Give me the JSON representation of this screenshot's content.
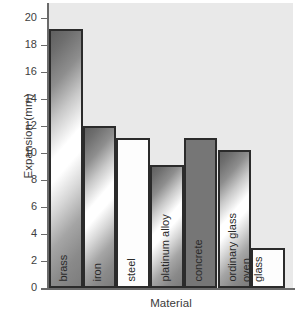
{
  "chart_data": {
    "type": "bar",
    "title": "",
    "xlabel": "Material",
    "ylabel": "Expansion (mm)",
    "categories": [
      "brass",
      "iron",
      "steel",
      "platinum alloy",
      "concrete",
      "ordinary glass",
      "oven\nglass"
    ],
    "values": [
      19.2,
      12.0,
      11.1,
      9.1,
      11.1,
      10.2,
      3.0
    ],
    "ylim": [
      0,
      20
    ],
    "ytick_labels": [
      "20",
      "18",
      "16",
      "14",
      "12",
      "10",
      "8",
      "6",
      "4",
      "2",
      "0"
    ],
    "ytick_values": [
      20,
      18,
      16,
      14,
      12,
      10,
      8,
      6,
      4,
      2,
      0
    ],
    "grid": false,
    "legend": "none",
    "bar_styles": [
      "metal",
      "metal",
      "plain",
      "metal",
      "solid",
      "metal",
      "plain"
    ],
    "colors": {
      "plot_background": "#e9e9e9",
      "bar_outline": "#2b2b2b",
      "axis_line": "#6a6a6a",
      "solid_bar": "#767676",
      "text": "#3a3a3a",
      "page_background": "#ffffff"
    }
  }
}
